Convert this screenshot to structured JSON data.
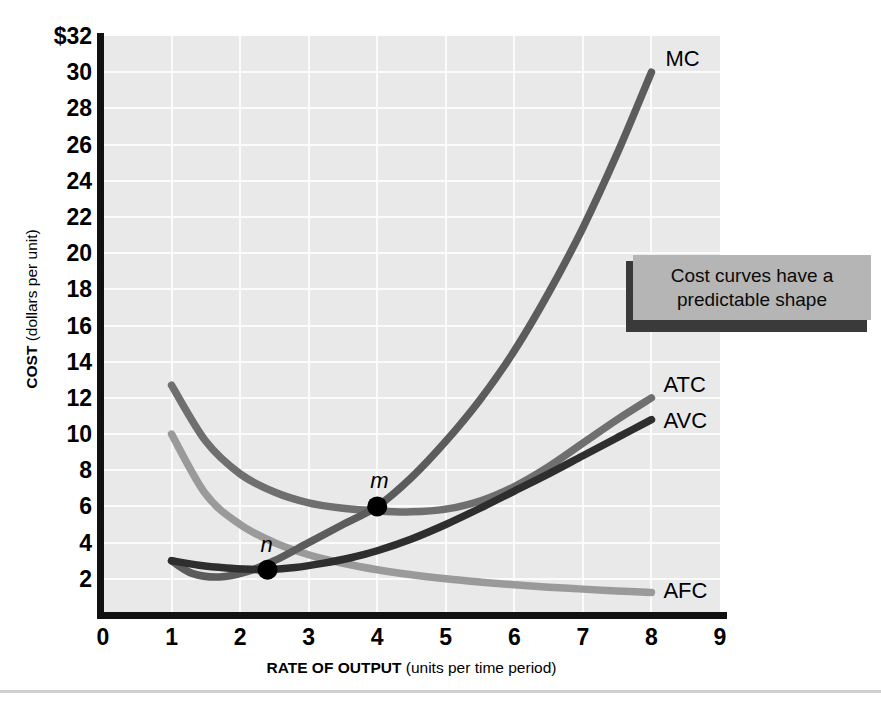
{
  "chart_data": {
    "type": "line",
    "title": "",
    "xlabel_bold": "RATE OF OUTPUT",
    "xlabel_sub": " (units per time period)",
    "ylabel_bold": "COST",
    "ylabel_sub": " (dollars per unit)",
    "xlim": [
      0,
      9
    ],
    "ylim": [
      0,
      32
    ],
    "grid": true,
    "x_ticks": [
      "0",
      "1",
      "2",
      "3",
      "4",
      "5",
      "6",
      "7",
      "8",
      "9"
    ],
    "y_ticks": [
      "$32",
      "30",
      "28",
      "26",
      "24",
      "22",
      "20",
      "18",
      "16",
      "14",
      "12",
      "10",
      "8",
      "6",
      "4",
      "2"
    ],
    "y_tick_values": [
      32,
      30,
      28,
      26,
      24,
      22,
      20,
      18,
      16,
      14,
      12,
      10,
      8,
      6,
      4,
      2
    ],
    "legend_position": "inline-right",
    "series": [
      {
        "name": "MC",
        "label": "MC",
        "color": "#5c5c5c",
        "x": [
          1.0,
          1.3,
          1.7,
          2.1,
          2.5,
          3.0,
          3.5,
          4.0,
          4.5,
          5.0,
          5.5,
          6.0,
          6.5,
          7.0,
          7.5,
          8.0
        ],
        "y": [
          3.0,
          2.3,
          2.1,
          2.4,
          3.0,
          4.0,
          5.0,
          6.0,
          7.6,
          9.6,
          11.9,
          14.6,
          17.8,
          21.4,
          25.5,
          30.0
        ]
      },
      {
        "name": "ATC",
        "label": "ATC",
        "color": "#6f6f6f",
        "x": [
          1.0,
          1.5,
          2.0,
          2.5,
          3.0,
          3.5,
          4.0,
          4.5,
          5.0,
          5.5,
          6.0,
          6.5,
          7.0,
          7.5,
          8.0
        ],
        "y": [
          12.7,
          9.6,
          7.8,
          6.8,
          6.2,
          5.9,
          5.75,
          5.7,
          5.85,
          6.3,
          7.1,
          8.2,
          9.5,
          10.8,
          12.0
        ]
      },
      {
        "name": "AVC",
        "label": "AVC",
        "color": "#2e2e2e",
        "x": [
          1.0,
          1.4,
          1.8,
          2.2,
          2.4,
          2.8,
          3.2,
          3.6,
          4.0,
          4.5,
          5.0,
          5.5,
          6.0,
          6.5,
          7.0,
          7.5,
          8.0
        ],
        "y": [
          3.0,
          2.75,
          2.6,
          2.52,
          2.5,
          2.62,
          2.85,
          3.15,
          3.55,
          4.2,
          5.0,
          5.9,
          6.85,
          7.8,
          8.8,
          9.8,
          10.8
        ]
      },
      {
        "name": "AFC",
        "label": "AFC",
        "color": "#9a9a9a",
        "x": [
          1.0,
          1.5,
          2.0,
          2.5,
          3.0,
          3.5,
          4.0,
          4.5,
          5.0,
          5.5,
          6.0,
          6.5,
          7.0,
          7.5,
          8.0
        ],
        "y": [
          10.0,
          6.67,
          5.0,
          4.0,
          3.33,
          2.86,
          2.5,
          2.22,
          2.0,
          1.82,
          1.67,
          1.54,
          1.43,
          1.33,
          1.25
        ]
      }
    ],
    "annotations": [
      {
        "name": "m",
        "label": "m",
        "x": 4.0,
        "y": 6.0,
        "note": "MC crosses ATC minimum region"
      },
      {
        "name": "n",
        "label": "n",
        "x": 2.4,
        "y": 2.5,
        "note": "MC crosses AVC minimum"
      }
    ]
  },
  "callout": {
    "text": "Cost curves have a predictable shape",
    "bg_color": "#b5b5b5",
    "shadow_color": "#3a3a3a"
  },
  "colors": {
    "plot_background": "#e9e9e9",
    "gridline": "#fbfbfb",
    "axis": "#111111",
    "page_background": "#ffffff"
  }
}
